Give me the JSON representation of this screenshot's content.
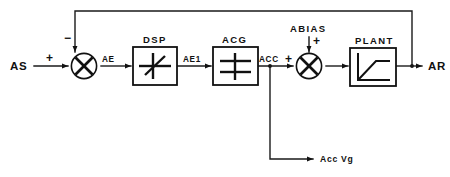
{
  "diagram": {
    "colors": {
      "ink": "#111111",
      "wire": "#1a1a1a",
      "background": "#ffffff"
    },
    "io": {
      "input_label": "AS",
      "output_label": "AR",
      "aux_output_label": "Acc Vg",
      "bias_label": "ABIAS"
    },
    "blocks": [
      {
        "id": "dsp",
        "label": "DSP",
        "glyph": "deadband-slash-glyph"
      },
      {
        "id": "acg",
        "label": "ACG",
        "glyph": "double-bar-glyph"
      },
      {
        "id": "plant",
        "label": "PLANT",
        "glyph": "saturation-curve-glyph"
      }
    ],
    "summers": [
      {
        "id": "error-summer",
        "glyph": "cross-circle-glyph",
        "inputs": [
          {
            "port": "left",
            "sign": "+"
          },
          {
            "port": "top",
            "sign": "−"
          }
        ]
      },
      {
        "id": "bias-summer",
        "glyph": "cross-circle-glyph",
        "inputs": [
          {
            "port": "left",
            "sign": "+"
          },
          {
            "port": "top",
            "sign": "+"
          }
        ]
      }
    ],
    "signals": [
      {
        "id": "ae",
        "label": "AE"
      },
      {
        "id": "ae1",
        "label": "AE1"
      },
      {
        "id": "acc",
        "label": "ACC"
      }
    ],
    "feedback": {
      "description": "output feedback to error summer negative input"
    }
  }
}
